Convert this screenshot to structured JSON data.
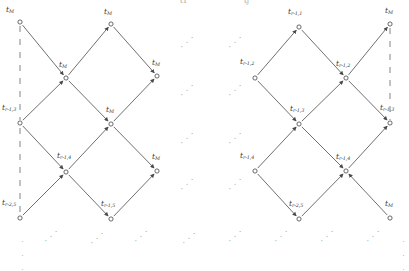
{
  "figure": {
    "type": "lattice-trellis-diagram",
    "stroke_color": "#555555",
    "node_fill": "#ffffff",
    "node_stroke": "#444444",
    "dash_color": "#777777",
    "width": 409,
    "height": 257
  },
  "top_cut_text": {
    "left": "t1",
    "right": "tj"
  },
  "nodes": [
    {
      "id": "L-n1",
      "base": "t",
      "sub": "M",
      "x": 20,
      "y": 22,
      "label_x": 6,
      "label_y": 6,
      "open": true
    },
    {
      "id": "L-n2",
      "base": "t",
      "sub": "M",
      "x": 111,
      "y": 24,
      "label_x": 104,
      "label_y": 8,
      "open": false
    },
    {
      "id": "L-n3",
      "base": "t",
      "sub": "M",
      "x": 66,
      "y": 78,
      "label_x": 59,
      "label_y": 61,
      "open": false
    },
    {
      "id": "L-n4",
      "base": "t",
      "sub": "M",
      "x": 157,
      "y": 76,
      "label_x": 152,
      "label_y": 59,
      "open": false
    },
    {
      "id": "L-n5",
      "base": "t",
      "sub": "r-1,3",
      "x": 20,
      "y": 123,
      "label_x": 2,
      "label_y": 104,
      "open": true
    },
    {
      "id": "L-n6",
      "base": "t",
      "sub": "M",
      "x": 111,
      "y": 124,
      "label_x": 106,
      "label_y": 106,
      "open": false
    },
    {
      "id": "L-n7",
      "base": "t",
      "sub": "r-1,4",
      "x": 66,
      "y": 172,
      "label_x": 57,
      "label_y": 152,
      "open": false
    },
    {
      "id": "L-n8",
      "base": "t",
      "sub": "M",
      "x": 157,
      "y": 171,
      "label_x": 152,
      "label_y": 153,
      "open": false
    },
    {
      "id": "L-n9",
      "base": "t",
      "sub": "r-2,5",
      "x": 20,
      "y": 218,
      "label_x": 2,
      "label_y": 199,
      "open": true
    },
    {
      "id": "L-n10",
      "base": "t",
      "sub": "r-1,5",
      "x": 111,
      "y": 219,
      "label_x": 101,
      "label_y": 200,
      "open": false
    },
    {
      "id": "R-n1",
      "base": "t",
      "sub": "r-1,1",
      "x": 299,
      "y": 27,
      "label_x": 288,
      "label_y": 8,
      "open": false
    },
    {
      "id": "R-n2",
      "base": "t",
      "sub": "M",
      "x": 390,
      "y": 24,
      "label_x": 385,
      "label_y": 7,
      "open": true
    },
    {
      "id": "R-n3",
      "base": "t",
      "sub": "r-1,2",
      "x": 255,
      "y": 78,
      "label_x": 240,
      "label_y": 58,
      "open": true
    },
    {
      "id": "R-n4",
      "base": "t",
      "sub": "r-1,2",
      "x": 346,
      "y": 78,
      "label_x": 336,
      "label_y": 60,
      "open": false
    },
    {
      "id": "R-n5",
      "base": "t",
      "sub": "r-1,3",
      "x": 299,
      "y": 124,
      "label_x": 290,
      "label_y": 105,
      "open": false
    },
    {
      "id": "R-n6",
      "base": "t",
      "sub": "r-1,3",
      "x": 390,
      "y": 123,
      "label_x": 380,
      "label_y": 104,
      "open": false
    },
    {
      "id": "R-n7",
      "base": "t",
      "sub": "r-1,4",
      "x": 255,
      "y": 171,
      "label_x": 240,
      "label_y": 152,
      "open": false
    },
    {
      "id": "R-n8",
      "base": "t",
      "sub": "r-1,4",
      "x": 346,
      "y": 171,
      "label_x": 336,
      "label_y": 153,
      "open": false
    },
    {
      "id": "R-n9",
      "base": "t",
      "sub": "r-2,5",
      "x": 299,
      "y": 219,
      "label_x": 289,
      "label_y": 200,
      "open": false
    },
    {
      "id": "R-n10",
      "base": "t",
      "sub": "M",
      "x": 390,
      "y": 218,
      "label_x": 385,
      "label_y": 200,
      "open": false
    }
  ],
  "edges": [
    {
      "from": "L-n1",
      "to": "L-n3",
      "arrow": true
    },
    {
      "from": "L-n3",
      "to": "L-n2",
      "arrow": true
    },
    {
      "from": "L-n2",
      "to": "L-n4",
      "arrow": true
    },
    {
      "from": "L-n5",
      "to": "L-n3",
      "arrow": true
    },
    {
      "from": "L-n3",
      "to": "L-n6",
      "arrow": true
    },
    {
      "from": "L-n6",
      "to": "L-n4",
      "arrow": true
    },
    {
      "from": "L-n5",
      "to": "L-n7",
      "arrow": true
    },
    {
      "from": "L-n7",
      "to": "L-n6",
      "arrow": true
    },
    {
      "from": "L-n6",
      "to": "L-n8",
      "arrow": true
    },
    {
      "from": "L-n9",
      "to": "L-n7",
      "arrow": true
    },
    {
      "from": "L-n7",
      "to": "L-n10",
      "arrow": true
    },
    {
      "from": "L-n10",
      "to": "L-n8",
      "arrow": true
    },
    {
      "from": "R-n3",
      "to": "R-n1",
      "arrow": true
    },
    {
      "from": "R-n1",
      "to": "R-n4",
      "arrow": true
    },
    {
      "from": "R-n4",
      "to": "R-n2",
      "arrow": true
    },
    {
      "from": "R-n3",
      "to": "R-n5",
      "arrow": true
    },
    {
      "from": "R-n5",
      "to": "R-n4",
      "arrow": true
    },
    {
      "from": "R-n4",
      "to": "R-n6",
      "arrow": true
    },
    {
      "from": "R-n7",
      "to": "R-n5",
      "arrow": true
    },
    {
      "from": "R-n5",
      "to": "R-n8",
      "arrow": true
    },
    {
      "from": "R-n8",
      "to": "R-n6",
      "arrow": true
    },
    {
      "from": "R-n7",
      "to": "R-n9",
      "arrow": true
    },
    {
      "from": "R-n9",
      "to": "R-n8",
      "arrow": true
    },
    {
      "from": "R-n10",
      "to": "R-n8",
      "arrow": true
    }
  ],
  "dashed_lines": [
    {
      "id": "left-boundary",
      "x1": 20,
      "y1": 26,
      "x2": 20,
      "y2": 120
    },
    {
      "id": "left-boundary2",
      "x1": 20,
      "y1": 128,
      "x2": 20,
      "y2": 215
    },
    {
      "id": "right-boundary",
      "x1": 390,
      "y1": 28,
      "x2": 390,
      "y2": 120
    }
  ],
  "ellipses": [
    {
      "id": "gap-left-1",
      "x": 178,
      "y": 44,
      "kind": "diag",
      "glyph": "."
    },
    {
      "id": "gap-left-2",
      "x": 178,
      "y": 92,
      "kind": "diag",
      "glyph": "."
    },
    {
      "id": "gap-left-3",
      "x": 178,
      "y": 140,
      "kind": "diag",
      "glyph": "."
    },
    {
      "id": "gap-left-4",
      "x": 178,
      "y": 186,
      "kind": "diag",
      "glyph": "."
    },
    {
      "id": "gap-right-1",
      "x": 226,
      "y": 44,
      "kind": "diag",
      "glyph": "."
    },
    {
      "id": "gap-right-2",
      "x": 226,
      "y": 92,
      "kind": "diag",
      "glyph": "."
    },
    {
      "id": "gap-right-3",
      "x": 226,
      "y": 140,
      "kind": "diag",
      "glyph": "."
    },
    {
      "id": "gap-right-4",
      "x": 226,
      "y": 186,
      "kind": "diag",
      "glyph": "."
    },
    {
      "id": "bottom-1",
      "x": 19,
      "y": 236,
      "kind": "vert",
      "glyph": "."
    },
    {
      "id": "bottom-2",
      "x": 42,
      "y": 238,
      "kind": "diag",
      "glyph": "."
    },
    {
      "id": "bottom-3",
      "x": 88,
      "y": 240,
      "kind": "diag",
      "glyph": "."
    },
    {
      "id": "bottom-4",
      "x": 132,
      "y": 238,
      "kind": "diag",
      "glyph": "."
    },
    {
      "id": "bottom-5",
      "x": 180,
      "y": 240,
      "kind": "diag",
      "glyph": "."
    },
    {
      "id": "bottom-6",
      "x": 226,
      "y": 238,
      "kind": "diag",
      "glyph": "."
    },
    {
      "id": "bottom-7",
      "x": 272,
      "y": 238,
      "kind": "diag",
      "glyph": "."
    },
    {
      "id": "bottom-8",
      "x": 318,
      "y": 238,
      "kind": "diag",
      "glyph": "."
    },
    {
      "id": "bottom-9",
      "x": 364,
      "y": 238,
      "kind": "diag",
      "glyph": "."
    },
    {
      "id": "bottom-10",
      "x": 400,
      "y": 236,
      "kind": "vert",
      "glyph": "."
    }
  ]
}
